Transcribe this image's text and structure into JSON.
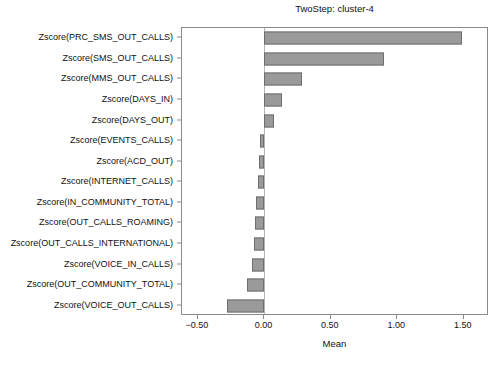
{
  "chart_data": {
    "type": "bar",
    "orientation": "horizontal",
    "title": "TwoStep: cluster-4",
    "xlabel": "Mean",
    "ylabel": "",
    "xlim": [
      -0.62,
      1.69
    ],
    "xticks": [
      -0.5,
      0.0,
      0.5,
      1.0,
      1.5
    ],
    "xtick_labels": [
      "−0.50",
      "0.00",
      "0.50",
      "1.00",
      "1.50"
    ],
    "grid": false,
    "legend": null,
    "bar_color": "#9a9a9a",
    "bar_edge_color": "#6e6e6e",
    "zero_line_color": "#b5b5b5",
    "axis_color": "#8b8b8b",
    "categories": [
      "Zscore(PRC_SMS_OUT_CALLS)",
      "Zscore(SMS_OUT_CALLS)",
      "Zscore(MMS_OUT_CALLS)",
      "Zscore(DAYS_IN)",
      "Zscore(DAYS_OUT)",
      "Zscore(EVENTS_CALLS)",
      "Zscore(ACD_OUT)",
      "Zscore(INTERNET_CALLS)",
      "Zscore(IN_COMMUNITY_TOTAL)",
      "Zscore(OUT_CALLS_ROAMING)",
      "Zscore(OUT_CALLS_INTERNATIONAL)",
      "Zscore(VOICE_IN_CALLS)",
      "Zscore(OUT_COMMUNITY_TOTAL)",
      "Zscore(VOICE_OUT_CALLS)"
    ],
    "values": [
      1.49,
      0.9,
      0.28,
      0.13,
      0.07,
      -0.03,
      -0.04,
      -0.05,
      -0.06,
      -0.07,
      -0.08,
      -0.09,
      -0.13,
      -0.28
    ]
  }
}
